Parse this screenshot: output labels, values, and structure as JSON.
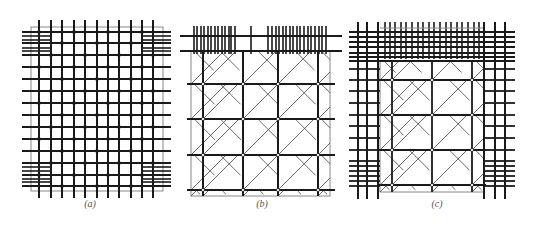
{
  "figure": {
    "panels": [
      {
        "id": "a",
        "caption": "(a)",
        "caption_x": 90,
        "caption_y": 205,
        "frame": {
          "x": 31,
          "y": 27,
          "w": 132,
          "h": 164
        },
        "verticals": [
          39,
          51,
          62,
          74,
          85,
          97,
          108,
          119,
          131,
          142,
          153
        ],
        "vertical_extent": [
          20,
          198
        ],
        "horizontals": [
          32,
          43,
          55,
          67,
          79,
          91,
          103,
          115,
          127,
          139,
          151,
          163,
          175,
          186
        ],
        "horizontal_extent": [
          22,
          171
        ],
        "corner_extra_lines": {
          "left_x": [
            22,
            51
          ],
          "right_x": [
            142,
            171
          ],
          "top_y": [
            36,
            40,
            48,
            51
          ],
          "bottom_y": [
            167,
            171,
            179,
            182
          ]
        }
      },
      {
        "id": "b",
        "caption": "(b)",
        "caption_x": 262,
        "caption_y": 205,
        "frame": {
          "x": 191,
          "y": 51,
          "w": 139,
          "h": 145
        },
        "top_band": {
          "y1": 36,
          "y2": 51,
          "rails_y": [
            36,
            51
          ],
          "rail_extent": [
            180,
            342
          ]
        },
        "top_ticks_x": [
          194,
          197,
          201,
          204,
          208,
          211,
          215,
          218,
          222,
          225,
          229,
          231,
          235,
          251,
          268,
          272,
          276,
          279,
          283,
          286,
          290,
          293,
          297,
          300,
          304,
          308,
          311,
          315,
          319,
          322,
          326
        ],
        "posts_x": [
          203,
          243,
          278,
          318
        ],
        "rows_y": [
          84,
          119,
          155,
          190
        ],
        "row_extent": [
          187,
          335
        ]
      },
      {
        "id": "c",
        "caption": "(c)",
        "caption_x": 437,
        "caption_y": 205,
        "frame": {
          "x": 380,
          "y": 61,
          "w": 104,
          "h": 131
        },
        "outer_verticals_left": [
          358,
          367,
          378
        ],
        "outer_verticals_right": [
          484,
          495,
          505
        ],
        "vertical_extent": [
          22,
          199
        ],
        "outer_horizontals": [
          32,
          37,
          42,
          47,
          53,
          57,
          61,
          69,
          80,
          91,
          103,
          115,
          126,
          138,
          150,
          161,
          166,
          171,
          176,
          181,
          186
        ],
        "horizontal_extent": [
          349,
          515
        ],
        "top_ticks_x": [
          385,
          390,
          395,
          401,
          406,
          412,
          418,
          423,
          429,
          434,
          440,
          446,
          451,
          457,
          462,
          468,
          474,
          479
        ],
        "top_band": {
          "y1": 28,
          "y2": 59
        },
        "posts_x": [
          392,
          432,
          472
        ],
        "rows_y": [
          80,
          115,
          150,
          185
        ],
        "row_extent": [
          378,
          486
        ]
      }
    ]
  },
  "colors": {
    "line": "#1a1a1a",
    "frame": "#888888",
    "diagonal": "#444444",
    "node_fill": "#ffffff"
  }
}
